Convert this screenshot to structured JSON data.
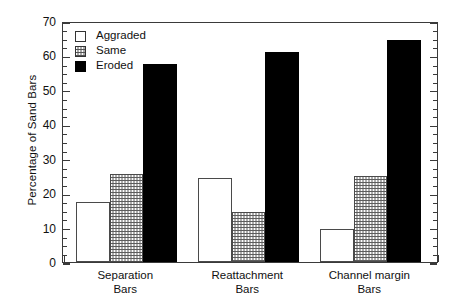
{
  "chart_data": {
    "type": "bar",
    "title": "",
    "xlabel": "",
    "ylabel": "Percentage of Sand Bars",
    "ylim": [
      0,
      70
    ],
    "ytick_labels": [
      "0",
      "10",
      "20",
      "30",
      "40",
      "50",
      "60",
      "70"
    ],
    "ytick_values": [
      0,
      10,
      20,
      30,
      40,
      50,
      60,
      70
    ],
    "minor_tick_step": 2.5,
    "grid": false,
    "legend_position": "top-left",
    "categories": [
      "Separation Bars",
      "Reattachment Bars",
      "Channel margin Bars"
    ],
    "category_lines": [
      [
        "Separation",
        "Bars"
      ],
      [
        "Reattachment",
        "Bars"
      ],
      [
        "Channel margin",
        "Bars"
      ]
    ],
    "series": [
      {
        "name": "Aggraded",
        "fill": "white",
        "values": [
          17.5,
          24.5,
          9.5
        ]
      },
      {
        "name": "Same",
        "fill": "stipple",
        "values": [
          25.5,
          14.5,
          25.0
        ]
      },
      {
        "name": "Eroded",
        "fill": "black",
        "values": [
          57.5,
          61.0,
          64.5
        ]
      }
    ]
  },
  "legend": {
    "items": [
      {
        "label": "Aggraded"
      },
      {
        "label": "Same"
      },
      {
        "label": "Eroded"
      }
    ]
  },
  "colors": {
    "axis": "#3a3a3a",
    "text": "#111111",
    "eroded": "#000000",
    "aggraded": "#ffffff",
    "same_stipple": "#5d5d5d",
    "background": "#ffffff"
  }
}
